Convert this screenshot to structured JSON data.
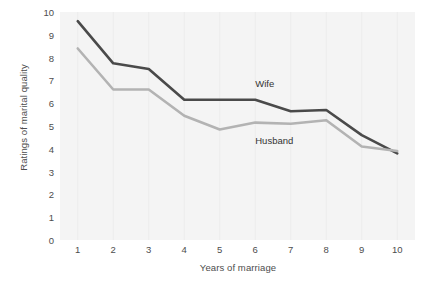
{
  "chart_data": {
    "type": "line",
    "title": "",
    "xlabel": "Years of marriage",
    "ylabel": "Ratings of marital quality",
    "x": [
      1,
      2,
      3,
      4,
      5,
      6,
      7,
      8,
      9,
      10
    ],
    "categories": [
      "1",
      "2",
      "3",
      "4",
      "5",
      "6",
      "7",
      "8",
      "9",
      "10"
    ],
    "xlim": [
      0.5,
      10.5
    ],
    "ylim": [
      0,
      10
    ],
    "y_ticks": [
      0,
      1,
      2,
      3,
      4,
      5,
      6,
      7,
      8,
      9,
      10
    ],
    "y_tick_labels": [
      "0",
      "1",
      "2",
      "3",
      "4",
      "5",
      "6",
      "7",
      "8",
      "9",
      "10"
    ],
    "grid": "vertical-only",
    "legend_position": "inline-annotations",
    "series": [
      {
        "name": "Wife",
        "color": "#4a4a4a",
        "line_width": 2.6,
        "values": [
          9.6,
          7.75,
          7.5,
          6.15,
          6.15,
          6.15,
          5.65,
          5.7,
          4.6,
          3.8
        ]
      },
      {
        "name": "Husband",
        "color": "#b3b3b3",
        "line_width": 2.6,
        "values": [
          8.4,
          6.6,
          6.6,
          5.45,
          4.85,
          5.15,
          5.1,
          5.25,
          4.1,
          3.9
        ]
      }
    ],
    "annotations": [
      {
        "text": "Wife",
        "series": "Wife",
        "x": 6.0,
        "y": 6.85
      },
      {
        "text": "Husband",
        "series": "Husband",
        "x": 6.0,
        "y": 4.35
      }
    ]
  },
  "colors": {
    "page_background": "#ffffff",
    "plot_background": "#f4f4f4",
    "gridline": "#ececec",
    "text": "#4d4d4d",
    "wife_line": "#4a4a4a",
    "husband_line": "#b3b3b3"
  }
}
